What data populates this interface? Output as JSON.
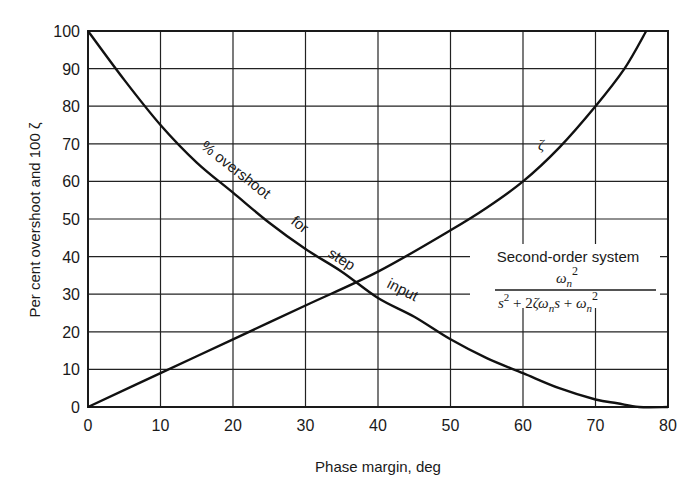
{
  "chart_data": {
    "type": "line",
    "title": "",
    "xlabel": "Phase margin, deg",
    "ylabel": "Per cent overshoot and 100 ζ",
    "xlim": [
      0,
      80
    ],
    "ylim": [
      0,
      100
    ],
    "x_ticks": [
      0,
      10,
      20,
      30,
      40,
      50,
      60,
      70,
      80
    ],
    "y_ticks": [
      0,
      10,
      20,
      30,
      40,
      50,
      60,
      70,
      80,
      90,
      100
    ],
    "grid": true,
    "legend": null,
    "series": [
      {
        "name": "% overshoot for step input",
        "x": [
          0,
          5,
          10,
          15,
          20,
          25,
          30,
          35,
          40,
          45,
          50,
          55,
          60,
          65,
          70,
          73,
          76,
          80
        ],
        "y": [
          100,
          87,
          75,
          65,
          57,
          49,
          42,
          36,
          29,
          24,
          18,
          13,
          9,
          5,
          2,
          1,
          0,
          0
        ]
      },
      {
        "name": "ζ (x100)",
        "x": [
          0,
          10,
          20,
          30,
          40,
          50,
          55,
          60,
          65,
          70,
          74,
          77
        ],
        "y": [
          0,
          9,
          18,
          27,
          36,
          47,
          53,
          60,
          69,
          80,
          90,
          100
        ]
      }
    ],
    "annotations": [
      {
        "text": "% overshoot",
        "near": [
          17,
          65
        ]
      },
      {
        "text": "for",
        "near": [
          28,
          46
        ]
      },
      {
        "text": "step",
        "near": [
          33,
          40
        ]
      },
      {
        "text": "input",
        "near": [
          42,
          27
        ]
      },
      {
        "text": "ζ",
        "near": [
          58,
          70
        ]
      },
      {
        "text": "Second-order system",
        "near": [
          65,
          40
        ]
      },
      {
        "text": "ωn² / (s² + 2ζωn s + ωn²)",
        "near": [
          65,
          30
        ]
      }
    ]
  },
  "labels": {
    "xlabel": "Phase margin, deg",
    "ylabel": "Per cent overshoot and 100 ζ",
    "curve_overshoot_1": "% overshoot",
    "curve_overshoot_2": "for",
    "curve_overshoot_3": "step",
    "curve_overshoot_4": "input",
    "curve_zeta": "ζ",
    "system_title": "Second-order system",
    "tf_num": "ω",
    "tf_num_sub": "n",
    "tf_num_sup": "2"
  }
}
